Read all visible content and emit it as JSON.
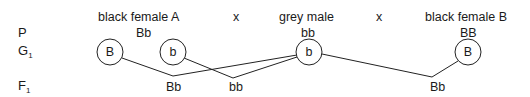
{
  "row_labels": {
    "parents": "P",
    "gametes_main": "G",
    "gametes_sub": "1",
    "offspring_main": "F",
    "offspring_sub": "1"
  },
  "parents": [
    {
      "name": "black female A",
      "genotype": "Bb"
    },
    {
      "name": "grey male",
      "genotype": "bb"
    },
    {
      "name": "black female B",
      "genotype": "BB"
    }
  ],
  "cross_symbols": [
    "x",
    "x"
  ],
  "gametes": [
    {
      "allele": "B",
      "parent": "black female A"
    },
    {
      "allele": "b",
      "parent": "black female A"
    },
    {
      "allele": "b",
      "parent": "grey male"
    },
    {
      "allele": "B",
      "parent": "black female B"
    }
  ],
  "offspring": [
    {
      "genotype": "Bb"
    },
    {
      "genotype": "bb"
    },
    {
      "genotype": "Bb"
    }
  ],
  "colors": {
    "ink": "#1a1a1a",
    "background": "#ffffff"
  }
}
